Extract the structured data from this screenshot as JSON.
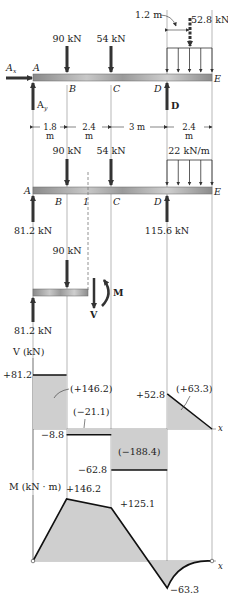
{
  "loading_diagram": {
    "point_labels": [
      "A",
      "B",
      "C",
      "D",
      "E"
    ],
    "reaction_labels": {
      "ax": "A",
      "ax_sub": "x",
      "ay": "A",
      "ay_sub": "y",
      "d": "D"
    },
    "loads": [
      {
        "label": "90 kN",
        "at": "B"
      },
      {
        "label": "54 kN",
        "at": "C"
      }
    ],
    "resultant": {
      "label": "52.8 kN",
      "offset_label": "1.2 m"
    },
    "spans": [
      {
        "top": "1.8",
        "bottom": "m"
      },
      {
        "top": "2.4",
        "bottom": "m"
      },
      {
        "top": "3 m",
        "bottom": ""
      },
      {
        "top": "2.4",
        "bottom": "m"
      }
    ]
  },
  "fbd_full": {
    "point_labels": [
      "A",
      "B",
      "1",
      "C",
      "D",
      "E"
    ],
    "loads": [
      "90 kN",
      "54 kN"
    ],
    "distributed_load": "22 kN/m",
    "reactions": {
      "a": "81.2 kN",
      "d": "115.6 kN"
    }
  },
  "fbd_section": {
    "load": "90 kN",
    "reaction": "81.2 kN",
    "shear_label": "V",
    "moment_label": "M"
  },
  "chart_data": [
    {
      "type": "area",
      "title": "Shear diagram",
      "ylabel": "V (kN)",
      "xlabel": "x",
      "x": [
        0,
        1.8,
        1.8,
        4.2,
        4.2,
        7.2,
        7.2,
        9.6
      ],
      "y": [
        81.2,
        81.2,
        -8.8,
        -8.8,
        -62.8,
        -62.8,
        52.8,
        0
      ],
      "value_labels": [
        "+81.2",
        "−8.8",
        "−62.8",
        "+52.8"
      ],
      "area_labels": [
        "(+146.2)",
        "(−21.1)",
        "(−188.4)",
        "(+63.3)"
      ],
      "yrange": [
        -62.8,
        81.2
      ]
    },
    {
      "type": "line",
      "title": "Bending-moment diagram",
      "ylabel": "M (kN · m)",
      "xlabel": "x",
      "x": [
        0,
        1.8,
        4.2,
        7.2,
        9.6
      ],
      "y": [
        0,
        146.2,
        125.1,
        -63.3,
        0
      ],
      "value_labels": [
        "+146.2",
        "+125.1",
        "−63.3"
      ],
      "yrange": [
        -63.3,
        146.2
      ]
    }
  ]
}
